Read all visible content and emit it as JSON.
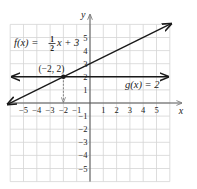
{
  "chart_data": {
    "type": "line",
    "title": "",
    "xlabel": "x",
    "ylabel": "y",
    "xlim": [
      -6,
      6
    ],
    "ylim": [
      -6,
      6
    ],
    "grid": true,
    "x_ticks": [
      -5,
      -4,
      -3,
      -2,
      -1,
      1,
      2,
      3,
      4,
      5
    ],
    "y_ticks": [
      -5,
      -4,
      -3,
      -2,
      -1,
      1,
      2,
      3,
      4,
      5
    ],
    "series": [
      {
        "name": "f(x) = ½x + 3",
        "slope": 0.5,
        "intercept": 3,
        "x": [
          -6,
          6
        ],
        "y": [
          0,
          6
        ]
      },
      {
        "name": "g(x) = 2",
        "slope": 0,
        "intercept": 2,
        "x": [
          -6,
          6
        ],
        "y": [
          2,
          2
        ]
      }
    ],
    "annotations": [
      {
        "text": "(−2, 2)",
        "x": -2,
        "y": 2,
        "type": "intersection-point"
      },
      {
        "text": "dashed arrow from (−2, 2) down to x-axis at x = −2",
        "x": -2
      }
    ]
  },
  "labels": {
    "f_prefix": "f(x) = ",
    "f_num": "1",
    "f_den": "2",
    "f_suffix": "x + 3",
    "g": "g(x) = 2",
    "point": "(−2, 2)",
    "x_axis": "x",
    "y_axis": "y"
  },
  "colors": {
    "grid": "#d4d4d4",
    "axis": "#555555",
    "line": "#1a1a1a"
  }
}
